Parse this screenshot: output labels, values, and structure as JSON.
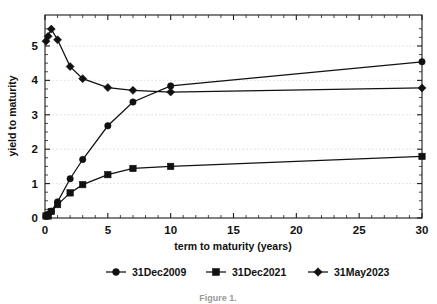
{
  "chart_data": {
    "type": "line",
    "title": "",
    "xlabel": "term to maturity (years)",
    "ylabel": "yield to maturity",
    "xlim": [
      0,
      30
    ],
    "ylim": [
      0,
      5.9
    ],
    "xticks": [
      0,
      5,
      10,
      15,
      20,
      25,
      30
    ],
    "xtick_labels": [
      "0",
      "5",
      "10",
      "15",
      "20",
      "25",
      "30"
    ],
    "yticks": [
      0,
      1,
      2,
      3,
      4,
      5
    ],
    "ytick_labels": [
      "0",
      "1",
      "2",
      "3",
      "4",
      "5"
    ],
    "grid": "horizontal-dotted",
    "legend_position": "bottom-center",
    "series": [
      {
        "name": "31Dec2009",
        "marker": "circle",
        "x": [
          0.08,
          0.25,
          0.5,
          1,
          2,
          3,
          5,
          7,
          10,
          30
        ],
        "y": [
          0.05,
          0.11,
          0.2,
          0.47,
          1.14,
          1.7,
          2.68,
          3.37,
          3.84,
          4.54
        ]
      },
      {
        "name": "31Dec2021",
        "marker": "square",
        "x": [
          0.08,
          0.25,
          0.5,
          1,
          2,
          3,
          5,
          7,
          10,
          30
        ],
        "y": [
          0.06,
          0.06,
          0.19,
          0.39,
          0.73,
          0.97,
          1.26,
          1.44,
          1.5,
          1.79
        ]
      },
      {
        "name": "31May2023",
        "marker": "diamond",
        "x": [
          0.08,
          0.25,
          0.5,
          1,
          2,
          3,
          5,
          7,
          10,
          30
        ],
        "y": [
          5.14,
          5.28,
          5.49,
          5.18,
          4.4,
          4.05,
          3.79,
          3.71,
          3.66,
          3.78
        ]
      }
    ]
  },
  "legend": {
    "items": [
      {
        "label": "31Dec2009",
        "marker": "circle"
      },
      {
        "label": "31Dec2021",
        "marker": "square"
      },
      {
        "label": "31May2023",
        "marker": "diamond"
      }
    ]
  },
  "caption": {
    "text": "Figure 1."
  },
  "colors": {
    "ink": "#111111",
    "grid": "#d9d9d9",
    "background": "#ffffff"
  }
}
